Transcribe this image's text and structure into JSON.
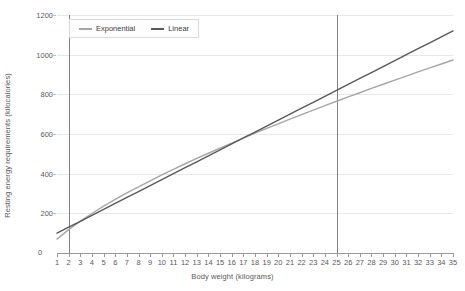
{
  "chart_data": {
    "type": "line",
    "title": "",
    "xlabel": "Body weight (kilograms)",
    "ylabel": "Resting energy requirements (kilocalories)",
    "xlim": [
      1,
      35
    ],
    "ylim": [
      0,
      1200
    ],
    "grid": true,
    "legend_position": "top-left",
    "x_ticks": [
      1,
      2,
      3,
      4,
      5,
      6,
      7,
      8,
      9,
      10,
      11,
      12,
      13,
      14,
      15,
      16,
      17,
      18,
      19,
      20,
      21,
      22,
      23,
      24,
      25,
      26,
      27,
      28,
      29,
      30,
      31,
      32,
      33,
      34,
      35
    ],
    "y_ticks": [
      0,
      200,
      400,
      600,
      800,
      1000,
      1200
    ],
    "zero_label": "0",
    "reference_lines": [
      {
        "name": "lower-reference-line",
        "x": 2,
        "color": "#808080"
      },
      {
        "name": "upper-reference-line",
        "x": 25,
        "color": "#808080"
      }
    ],
    "x": [
      1,
      2,
      3,
      4,
      5,
      6,
      7,
      8,
      9,
      10,
      11,
      12,
      13,
      14,
      15,
      16,
      17,
      18,
      19,
      20,
      21,
      22,
      23,
      24,
      25,
      26,
      27,
      28,
      29,
      30,
      31,
      32,
      33,
      34,
      35
    ],
    "series": [
      {
        "name": "Exponential",
        "color": "#a6a6a6",
        "values": [
          70,
          118,
          161,
          199,
          236,
          270,
          303,
          334,
          364,
          394,
          422,
          450,
          477,
          503,
          529,
          554,
          579,
          604,
          628,
          651,
          675,
          698,
          720,
          743,
          765,
          787,
          808,
          830,
          851,
          872,
          892,
          913,
          933,
          953,
          973
        ]
      },
      {
        "name": "Linear",
        "color": "#595959",
        "values": [
          100,
          130,
          160,
          190,
          220,
          250,
          280,
          310,
          340,
          370,
          400,
          430,
          460,
          490,
          520,
          550,
          580,
          610,
          640,
          670,
          700,
          730,
          760,
          790,
          820,
          850,
          880,
          910,
          940,
          970,
          1000,
          1030,
          1060,
          1090,
          1120
        ]
      }
    ]
  }
}
